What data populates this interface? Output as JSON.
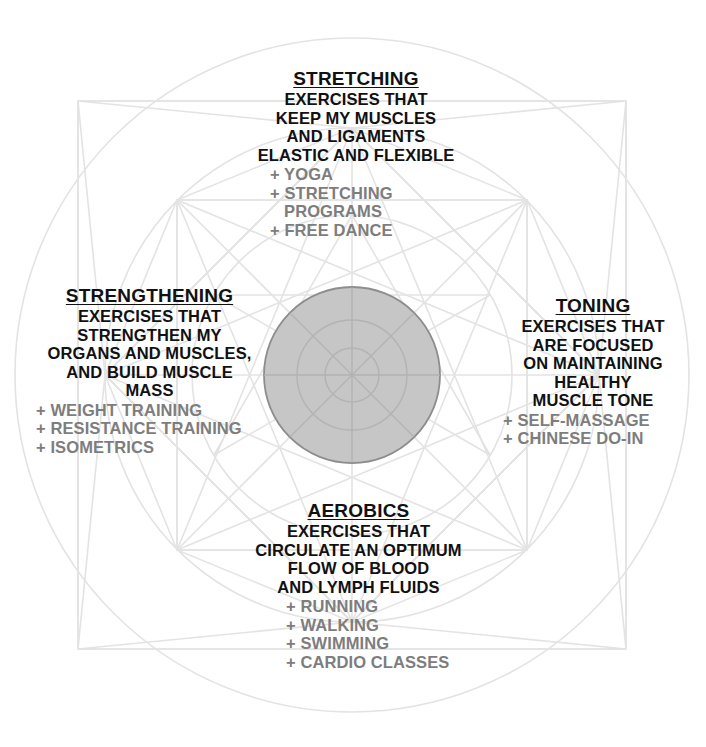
{
  "diagram": {
    "colors": {
      "title_text": "#111111",
      "body_text": "#111111",
      "list_text": "#7d7d7d",
      "line": "#e3e3e3",
      "center_fill": "#c6c6c6",
      "center_stroke": "#8d8d8d",
      "background": "#ffffff"
    },
    "geometry": {
      "center_x": 352,
      "center_y": 375,
      "outer_radius": 337,
      "square_half": 274,
      "mid_radius": 247,
      "inner_ring_radius": 160,
      "hub_radius": 88,
      "hub_inner_radius": 55,
      "hub_core_radius": 27
    }
  },
  "quadrants": [
    {
      "id": "stretching",
      "title": "STRETCHING",
      "description": [
        "EXERCISES THAT",
        "KEEP MY MUSCLES",
        "AND LIGAMENTS",
        "ELASTIC AND FLEXIBLE"
      ],
      "items": [
        "+ YOGA",
        "+ STRETCHING",
        "   PROGRAMS",
        "+ FREE DANCE"
      ]
    },
    {
      "id": "strengthening",
      "title": "STRENGTHENING",
      "description": [
        "EXERCISES THAT",
        "STRENGTHEN MY",
        "ORGANS AND MUSCLES,",
        "AND BUILD MUSCLE",
        "MASS"
      ],
      "items": [
        "+ WEIGHT TRAINING",
        "+ RESISTANCE TRAINING",
        "+ ISOMETRICS"
      ]
    },
    {
      "id": "toning",
      "title": "TONING",
      "description": [
        "EXERCISES THAT",
        "ARE FOCUSED",
        "ON MAINTAINING",
        "HEALTHY",
        "MUSCLE TONE"
      ],
      "items": [
        "+ SELF-MASSAGE",
        "+ CHINESE DO-IN"
      ]
    },
    {
      "id": "aerobics",
      "title": "AEROBICS",
      "description": [
        "EXERCISES THAT",
        "CIRCULATE AN OPTIMUM",
        "FLOW OF BLOOD",
        "AND LYMPH FLUIDS"
      ],
      "items": [
        "+ RUNNING",
        "+ WALKING",
        "+ SWIMMING",
        "+ CARDIO CLASSES"
      ]
    }
  ]
}
